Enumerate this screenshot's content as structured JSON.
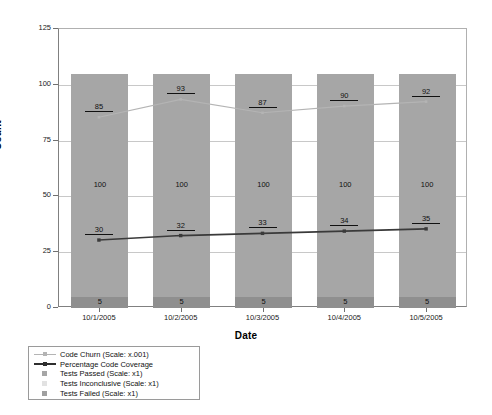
{
  "chart_data": {
    "type": "bar",
    "title": "",
    "subtitle": "",
    "xlabel": "Date",
    "ylabel": "Count",
    "categories": [
      "10/1/2005",
      "10/2/2005",
      "10/3/2005",
      "10/4/2005",
      "10/5/2005"
    ],
    "ylim": [
      0,
      125
    ],
    "yticks": [
      0,
      25,
      50,
      75,
      100,
      125
    ],
    "grid": true,
    "legend_position": "below-left",
    "stacked": true,
    "series": [
      {
        "name": "Code Churn (Scale: x.001)",
        "render": "line",
        "color": "#b4b4b4",
        "marker": "square",
        "values": [
          85,
          93,
          87,
          90,
          92
        ],
        "labels": [
          "85",
          "93",
          "87",
          "90",
          "92"
        ]
      },
      {
        "name": "Percentage Code Coverage",
        "render": "line",
        "color": "#3a3a3a",
        "marker": "square",
        "values": [
          30,
          32,
          33,
          34,
          35
        ],
        "labels": [
          "30",
          "32",
          "33",
          "34",
          "35"
        ]
      },
      {
        "name": "Tests Passed (Scale: x1)",
        "render": "bar",
        "color": "#a6a6a6",
        "values": [
          100,
          100,
          100,
          100,
          100
        ],
        "labels": [
          "100",
          "100",
          "100",
          "100",
          "100"
        ]
      },
      {
        "name": "Tests Inconclusive (Scale: x1)",
        "render": "bar",
        "color": "#e2e2e2",
        "values": [
          0,
          0,
          0,
          0,
          0
        ],
        "labels": [
          "",
          "",
          "",
          "",
          ""
        ]
      },
      {
        "name": "Tests Failed (Scale: x1)",
        "render": "bar",
        "color": "#8f8f8f",
        "values": [
          5,
          5,
          5,
          5,
          5
        ],
        "labels": [
          "5",
          "5",
          "5",
          "5",
          "5"
        ]
      }
    ]
  },
  "axes": {
    "y_title": "Count",
    "x_title": "Date",
    "y_tick_labels": [
      "0",
      "25",
      "50",
      "75",
      "100",
      "125"
    ],
    "x_tick_labels": [
      "10/1/2005",
      "10/2/2005",
      "10/3/2005",
      "10/4/2005",
      "10/5/2005"
    ]
  },
  "legend": {
    "items": [
      {
        "label": "Code Churn (Scale: x.001)",
        "style": "line-light",
        "color": "#b4b4b4"
      },
      {
        "label": "Percentage Code Coverage",
        "style": "line-dark",
        "color": "#2e2e2e"
      },
      {
        "label": "Tests Passed (Scale: x1)",
        "style": "swatch",
        "color": "#a6a6a6"
      },
      {
        "label": "Tests Inconclusive (Scale: x1)",
        "style": "swatch",
        "color": "#e2e2e2"
      },
      {
        "label": "Tests Failed (Scale: x1)",
        "style": "swatch",
        "color": "#a0a0a0"
      }
    ]
  }
}
